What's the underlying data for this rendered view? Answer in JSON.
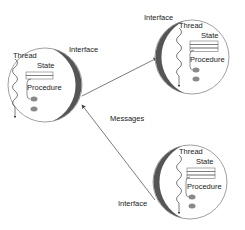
{
  "diagram": {
    "colors": {
      "background": "#ffffff",
      "outline": "#666666",
      "interface_band": "#555555",
      "procedure_blob": "#8a8a8a",
      "text": "#222222"
    },
    "objects": [
      {
        "id": "object-left",
        "interface_label": "Interface",
        "thread_label": "Thread",
        "state_label": "State",
        "procedure_label": "Procedure"
      },
      {
        "id": "object-top-right",
        "interface_label": "Interface",
        "thread_label": "Thread",
        "state_label": "State",
        "procedure_label": "Procedure"
      },
      {
        "id": "object-bottom-right",
        "interface_label": "Interface",
        "thread_label": "Thread",
        "state_label": "State",
        "procedure_label": "Procedure"
      }
    ],
    "edge_label": "Messages"
  }
}
